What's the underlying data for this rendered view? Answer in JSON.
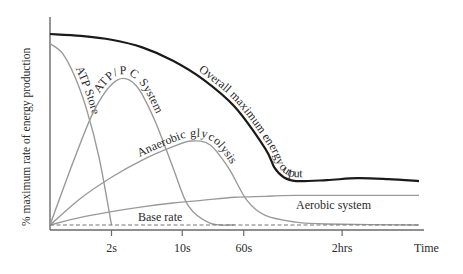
{
  "chart_data": {
    "type": "line",
    "title": "",
    "xlabel": "Time",
    "ylabel": "% maximum rate of energy production",
    "x_scale": "ordinal-time (non-linear)",
    "x_ticks": [
      "2s",
      "10s",
      "60s",
      "2hrs"
    ],
    "ylim": [
      0,
      100
    ],
    "grid": false,
    "legend": "none (inline curve labels)",
    "series": [
      {
        "name": "Overall maximum energy output",
        "label": "Overall maximum energy output",
        "emphasis": true,
        "points": [
          [
            0,
            100
          ],
          [
            1,
            99
          ],
          [
            2,
            97
          ],
          [
            3,
            93
          ],
          [
            4,
            86
          ],
          [
            5,
            76
          ],
          [
            6,
            62
          ],
          [
            7,
            40
          ],
          [
            7.3,
            30
          ],
          [
            7.6,
            25
          ],
          [
            8,
            23
          ],
          [
            9,
            23.5
          ],
          [
            10,
            24.5
          ],
          [
            11,
            24
          ],
          [
            12,
            23
          ]
        ]
      },
      {
        "name": "ATP Store",
        "label": "ATP Store",
        "points": [
          [
            0,
            95
          ],
          [
            0.4,
            90
          ],
          [
            0.8,
            78
          ],
          [
            1.2,
            60
          ],
          [
            1.6,
            35
          ],
          [
            2,
            0
          ]
        ]
      },
      {
        "name": "ATP/PC System",
        "label": "ATP/PC System",
        "points": [
          [
            0,
            0
          ],
          [
            0.8,
            35
          ],
          [
            1.5,
            62
          ],
          [
            2.2,
            76
          ],
          [
            2.8,
            73
          ],
          [
            3.4,
            55
          ],
          [
            4,
            30
          ],
          [
            4.5,
            10
          ],
          [
            5.2,
            1
          ],
          [
            6,
            0
          ]
        ]
      },
      {
        "name": "Anaerobic glycolysis",
        "label": "Anaerobic glycolysis",
        "points": [
          [
            0,
            0
          ],
          [
            1,
            14
          ],
          [
            2,
            25
          ],
          [
            3,
            34
          ],
          [
            4,
            41
          ],
          [
            4.6,
            44
          ],
          [
            5.2,
            42
          ],
          [
            5.8,
            30
          ],
          [
            6.4,
            13
          ],
          [
            7,
            5
          ],
          [
            8,
            1.5
          ],
          [
            9,
            0.5
          ],
          [
            12,
            0
          ]
        ]
      },
      {
        "name": "Aerobic system",
        "label": "Aerobic system",
        "points": [
          [
            0,
            0
          ],
          [
            1,
            4
          ],
          [
            2,
            7
          ],
          [
            3,
            9.5
          ],
          [
            4,
            11.5
          ],
          [
            5,
            13
          ],
          [
            6,
            14.5
          ],
          [
            7,
            15
          ],
          [
            8,
            15.5
          ],
          [
            12,
            15.5
          ]
        ]
      },
      {
        "name": "Base rate",
        "label": "Base rate",
        "style": "dashed",
        "points": [
          [
            0,
            0
          ],
          [
            12,
            0
          ]
        ]
      }
    ],
    "x_tick_positions": [
      2,
      4.3,
      6.3,
      9.5
    ],
    "xlim": [
      0,
      12
    ]
  }
}
